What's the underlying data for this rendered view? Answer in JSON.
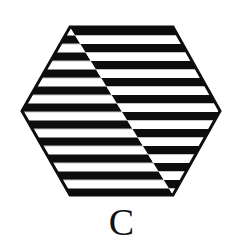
{
  "figure": {
    "caption": "C",
    "shape_name": "hexagon",
    "colors": {
      "stripe_dark": "#0d0d0d",
      "stripe_light": "#ffffff",
      "outline": "#0d0d0d",
      "background": "#ffffff",
      "caption_text": "#111111"
    },
    "geometry": {
      "hexagon_vertices": [
        [
          70,
          27
        ],
        [
          173,
          27
        ],
        [
          220,
          111
        ],
        [
          173,
          195
        ],
        [
          70,
          195
        ],
        [
          22,
          111
        ]
      ],
      "diagonal_split": [
        [
          70,
          27
        ],
        [
          173,
          195
        ]
      ],
      "outline_width": 3,
      "stripe_period": 17,
      "stripe_thickness": 8.5,
      "stripe_count": 10,
      "left_phase_offset": 8.5,
      "right_phase_offset": 0
    }
  },
  "chart_data": {
    "type": "table",
    "title": "C",
    "xlabel": "",
    "ylabel": "",
    "categories": [
      "left-region",
      "right-region"
    ],
    "series": [
      {
        "name": "stripe_phase_offset_px",
        "values": [
          8.5,
          0
        ]
      },
      {
        "name": "stripe_period_px",
        "values": [
          17,
          17
        ]
      }
    ],
    "annotations": [
      "C"
    ]
  }
}
